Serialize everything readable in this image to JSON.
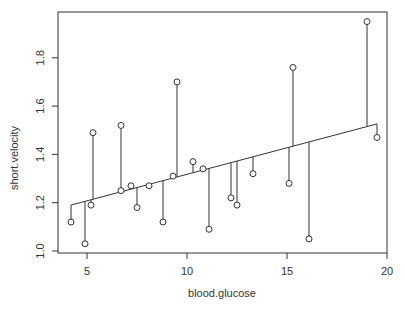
{
  "chart_data": {
    "type": "scatter",
    "title": "",
    "xlabel": "blood.glucose",
    "ylabel": "short.velocity",
    "xlim": [
      3.6,
      20.1
    ],
    "ylim": [
      0.99,
      1.98
    ],
    "x_ticks": [
      5,
      10,
      15,
      20
    ],
    "x_tick_labels": [
      "5",
      "10",
      "15",
      "20"
    ],
    "y_ticks": [
      1.0,
      1.2,
      1.4,
      1.6,
      1.8
    ],
    "y_tick_labels": [
      "1.0",
      "1.2",
      "1.4",
      "1.6",
      "1.8"
    ],
    "grid": false,
    "legend": null,
    "marker": "open-circle",
    "regression_line": {
      "intercept": 1.098,
      "slope": 0.02196,
      "x_range": [
        4.2,
        19.5
      ]
    },
    "residual_segments": true,
    "points": [
      {
        "x": 4.2,
        "y": 1.12
      },
      {
        "x": 4.9,
        "y": 1.03
      },
      {
        "x": 5.2,
        "y": 1.19
      },
      {
        "x": 5.3,
        "y": 1.49
      },
      {
        "x": 6.7,
        "y": 1.52
      },
      {
        "x": 6.7,
        "y": 1.25
      },
      {
        "x": 7.2,
        "y": 1.27
      },
      {
        "x": 7.5,
        "y": 1.18
      },
      {
        "x": 8.1,
        "y": 1.27
      },
      {
        "x": 8.8,
        "y": 1.12
      },
      {
        "x": 9.3,
        "y": 1.31
      },
      {
        "x": 9.5,
        "y": 1.7
      },
      {
        "x": 10.3,
        "y": 1.37
      },
      {
        "x": 10.8,
        "y": 1.34
      },
      {
        "x": 11.1,
        "y": 1.09
      },
      {
        "x": 12.2,
        "y": 1.22
      },
      {
        "x": 12.5,
        "y": 1.19
      },
      {
        "x": 13.3,
        "y": 1.32
      },
      {
        "x": 15.1,
        "y": 1.28
      },
      {
        "x": 15.3,
        "y": 1.76
      },
      {
        "x": 16.1,
        "y": 1.05
      },
      {
        "x": 19.0,
        "y": 1.95
      },
      {
        "x": 19.5,
        "y": 1.47
      }
    ]
  },
  "style": {
    "axis_color": "#333333",
    "point_color": "#333333",
    "line_color": "#333333",
    "background": "#ffffff"
  }
}
